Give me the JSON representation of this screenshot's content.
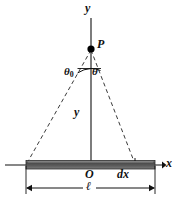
{
  "figure": {
    "kind": "physics-diagram",
    "background_color": "#ffffff",
    "ink_color": "#111111",
    "rod_color_dark": "#3d3d3d",
    "rod_color_mid": "#6e6e6e",
    "rod_color_light": "#9a9a9a",
    "labels": {
      "y_axis": "y",
      "point_p": "P",
      "theta_zero": "θ",
      "theta_zero_sub": "0",
      "theta": "θ",
      "distance_y": "y",
      "origin": "O",
      "element_dx": "dx",
      "x_axis": "x",
      "length_ell": "ℓ"
    },
    "geometry": {
      "point_p": [
        91,
        49
      ],
      "origin": [
        91,
        165
      ],
      "rod_left_end": [
        26,
        165
      ],
      "rod_right_end": [
        155,
        165
      ],
      "dx_tick": [
        135,
        165
      ],
      "y_axis_top": [
        91,
        18
      ],
      "x_axis_left": [
        5,
        165
      ],
      "x_axis_right": [
        165,
        165
      ],
      "dimension_line_y": 188,
      "dimension_left": 26,
      "dimension_right": 155
    }
  }
}
